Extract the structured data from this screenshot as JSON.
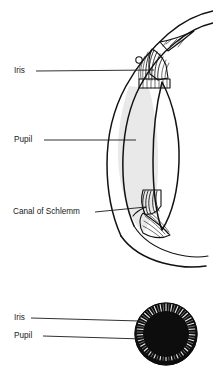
{
  "figure": {
    "background_color": "#ffffff",
    "line_color": "#111111",
    "text_color": "#1a1a1a",
    "shade_color": "#e8e8e8",
    "fill_dark_color": "#0d0d0d"
  },
  "sagittal_diagram": {
    "name": "anterior-eye-cross-section",
    "labels": [
      {
        "id": "iris",
        "text": "Iris",
        "x": 14,
        "y": 71,
        "leader_from_x": 36,
        "leader_from_y": 71,
        "leader_to_x": 154,
        "leader_to_y": 70
      },
      {
        "id": "pupil",
        "text": "Pupil",
        "x": 14,
        "y": 140,
        "leader_from_x": 44,
        "leader_from_y": 140,
        "leader_to_x": 136,
        "leader_to_y": 140
      },
      {
        "id": "canal-of-schlemm",
        "text": "Canal of Schlemm",
        "x": 13,
        "y": 212,
        "leader_from_x": 95,
        "leader_from_y": 212,
        "leader_to_x": 146,
        "leader_to_y": 207
      }
    ]
  },
  "frontal_diagram": {
    "name": "iris-frontal-view",
    "center_x": 166,
    "center_y": 334,
    "outer_radius": 31,
    "pupil_radius": 23,
    "labels": [
      {
        "id": "iris",
        "text": "Iris",
        "x": 14,
        "y": 318,
        "leader_from_x": 31,
        "leader_from_y": 318,
        "leader_to_x": 140,
        "leader_to_y": 321
      },
      {
        "id": "pupil",
        "text": "Pupil",
        "x": 14,
        "y": 336,
        "leader_from_x": 43,
        "leader_from_y": 336,
        "leader_to_x": 143,
        "leader_to_y": 339
      }
    ]
  }
}
